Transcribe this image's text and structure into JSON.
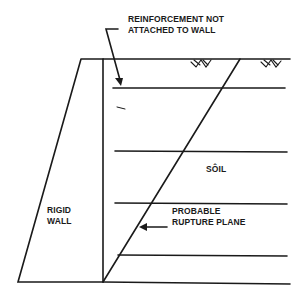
{
  "diagram": {
    "title": "",
    "labels": {
      "reinforcement_line1": "REINFORCEMENT NOT",
      "reinforcement_line2": "ATTACHED TO WALL",
      "soil": "SÔIL",
      "wall_line1": "RIGID",
      "wall_line2": "WALL",
      "rupture_line1": "PROBABLE",
      "rupture_line2": "RUPTURE PLANE"
    },
    "elements": {
      "rigid_wall": {
        "shape": "trapezoid",
        "top_left": [
          81,
          59
        ],
        "top_right": [
          103,
          59
        ],
        "bottom_left": [
          18,
          282
        ],
        "bottom_right": [
          103,
          282
        ]
      },
      "ground_surface": {
        "y": 59,
        "x_start": 81,
        "x_end": 290
      },
      "base_line": {
        "y": 282,
        "x_start": 18,
        "x_end": 290
      },
      "reinforcement_layers_y": [
        88,
        151,
        203,
        255
      ],
      "rupture_plane": {
        "from": [
          103,
          282
        ],
        "to": [
          240,
          59
        ]
      },
      "grass_symbols": [
        [
          208,
          64
        ],
        [
          278,
          64
        ]
      ]
    },
    "colors": {
      "line": "#1a1a1a",
      "background": "#ffffff"
    }
  }
}
